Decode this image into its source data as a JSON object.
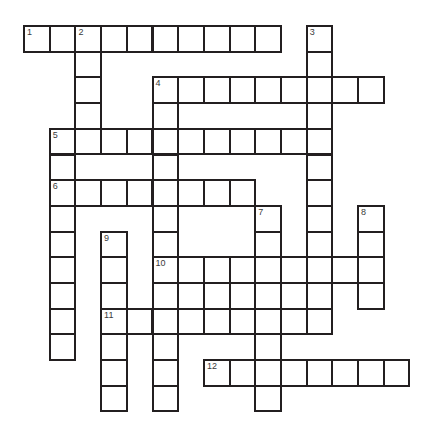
{
  "puzzle": {
    "title": "Crossword Puzzle Grid",
    "type": "crossword-grid",
    "grid": {
      "origin_x": 23,
      "origin_y": 25,
      "cell_size": 25.7,
      "columns": 16,
      "rows": 15,
      "cell_fill": "#ffffff",
      "cell_border": "#231f20",
      "background": "#ffffff"
    },
    "numbers": [
      {
        "label": "1",
        "col": 1,
        "row": 1
      },
      {
        "label": "2",
        "col": 3,
        "row": 1
      },
      {
        "label": "3",
        "col": 12,
        "row": 1
      },
      {
        "label": "4",
        "col": 6,
        "row": 3
      },
      {
        "label": "5",
        "col": 2,
        "row": 5
      },
      {
        "label": "6",
        "col": 2,
        "row": 7
      },
      {
        "label": "7",
        "col": 10,
        "row": 8
      },
      {
        "label": "8",
        "col": 14,
        "row": 8
      },
      {
        "label": "9",
        "col": 4,
        "row": 9
      },
      {
        "label": "10",
        "col": 6,
        "row": 10
      },
      {
        "label": "11",
        "col": 4,
        "row": 12
      },
      {
        "label": "12",
        "col": 8,
        "row": 14
      }
    ],
    "entries": [
      {
        "number": "1",
        "direction": "across",
        "col": 1,
        "row": 1,
        "length": 10
      },
      {
        "number": "2",
        "direction": "down",
        "col": 3,
        "row": 1,
        "length": 13
      },
      {
        "number": "3",
        "direction": "down",
        "col": 12,
        "row": 1,
        "length": 12
      },
      {
        "number": "4",
        "direction": "across",
        "col": 6,
        "row": 3,
        "length": 9
      },
      {
        "number": "4",
        "direction": "down",
        "col": 6,
        "row": 3,
        "length": 12
      },
      {
        "number": "5",
        "direction": "across",
        "col": 2,
        "row": 5,
        "length": 10
      },
      {
        "number": "6",
        "direction": "across",
        "col": 2,
        "row": 7,
        "length": 8
      },
      {
        "number": "6",
        "direction": "down",
        "col": 2,
        "row": 7,
        "length": 7
      },
      {
        "number": "7",
        "direction": "down",
        "col": 10,
        "row": 8,
        "length": 7
      },
      {
        "number": "8",
        "direction": "down",
        "col": 14,
        "row": 8,
        "length": 4
      },
      {
        "number": "9",
        "direction": "down",
        "col": 4,
        "row": 9,
        "length": 6
      },
      {
        "number": "10",
        "direction": "across",
        "col": 6,
        "row": 10,
        "length": 9
      },
      {
        "number": "11",
        "direction": "across",
        "col": 4,
        "row": 12,
        "length": 8
      },
      {
        "number": "12",
        "direction": "across",
        "col": 8,
        "row": 14,
        "length": 8
      }
    ],
    "cells": [
      {
        "col": 1,
        "row": 1
      },
      {
        "col": 2,
        "row": 1
      },
      {
        "col": 3,
        "row": 1
      },
      {
        "col": 4,
        "row": 1
      },
      {
        "col": 5,
        "row": 1
      },
      {
        "col": 6,
        "row": 1
      },
      {
        "col": 7,
        "row": 1
      },
      {
        "col": 8,
        "row": 1
      },
      {
        "col": 9,
        "row": 1
      },
      {
        "col": 10,
        "row": 1
      },
      {
        "col": 12,
        "row": 1
      },
      {
        "col": 3,
        "row": 2
      },
      {
        "col": 12,
        "row": 2
      },
      {
        "col": 3,
        "row": 3
      },
      {
        "col": 6,
        "row": 3
      },
      {
        "col": 7,
        "row": 3
      },
      {
        "col": 8,
        "row": 3
      },
      {
        "col": 9,
        "row": 3
      },
      {
        "col": 10,
        "row": 3
      },
      {
        "col": 11,
        "row": 3
      },
      {
        "col": 12,
        "row": 3
      },
      {
        "col": 13,
        "row": 3
      },
      {
        "col": 14,
        "row": 3
      },
      {
        "col": 3,
        "row": 4
      },
      {
        "col": 6,
        "row": 4
      },
      {
        "col": 12,
        "row": 4
      },
      {
        "col": 2,
        "row": 5
      },
      {
        "col": 3,
        "row": 5
      },
      {
        "col": 4,
        "row": 5
      },
      {
        "col": 5,
        "row": 5
      },
      {
        "col": 6,
        "row": 5
      },
      {
        "col": 7,
        "row": 5
      },
      {
        "col": 8,
        "row": 5
      },
      {
        "col": 9,
        "row": 5
      },
      {
        "col": 10,
        "row": 5
      },
      {
        "col": 11,
        "row": 5
      },
      {
        "col": 12,
        "row": 5
      },
      {
        "col": 2,
        "row": 6
      },
      {
        "col": 6,
        "row": 6
      },
      {
        "col": 12,
        "row": 6
      },
      {
        "col": 2,
        "row": 7
      },
      {
        "col": 3,
        "row": 7
      },
      {
        "col": 4,
        "row": 7
      },
      {
        "col": 5,
        "row": 7
      },
      {
        "col": 6,
        "row": 7
      },
      {
        "col": 7,
        "row": 7
      },
      {
        "col": 8,
        "row": 7
      },
      {
        "col": 9,
        "row": 7
      },
      {
        "col": 12,
        "row": 7
      },
      {
        "col": 2,
        "row": 8
      },
      {
        "col": 6,
        "row": 8
      },
      {
        "col": 10,
        "row": 8
      },
      {
        "col": 12,
        "row": 8
      },
      {
        "col": 14,
        "row": 8
      },
      {
        "col": 2,
        "row": 9
      },
      {
        "col": 4,
        "row": 9
      },
      {
        "col": 6,
        "row": 9
      },
      {
        "col": 10,
        "row": 9
      },
      {
        "col": 12,
        "row": 9
      },
      {
        "col": 14,
        "row": 9
      },
      {
        "col": 2,
        "row": 10
      },
      {
        "col": 4,
        "row": 10
      },
      {
        "col": 6,
        "row": 10
      },
      {
        "col": 7,
        "row": 10
      },
      {
        "col": 8,
        "row": 10
      },
      {
        "col": 9,
        "row": 10
      },
      {
        "col": 10,
        "row": 10
      },
      {
        "col": 11,
        "row": 10
      },
      {
        "col": 12,
        "row": 10
      },
      {
        "col": 13,
        "row": 10
      },
      {
        "col": 14,
        "row": 10
      },
      {
        "col": 2,
        "row": 11
      },
      {
        "col": 4,
        "row": 11
      },
      {
        "col": 6,
        "row": 11
      },
      {
        "col": 8,
        "row": 11
      },
      {
        "col": 10,
        "row": 11
      },
      {
        "col": 12,
        "row": 11
      },
      {
        "col": 14,
        "row": 11
      },
      {
        "col": 2,
        "row": 12
      },
      {
        "col": 4,
        "row": 12
      },
      {
        "col": 5,
        "row": 12
      },
      {
        "col": 6,
        "row": 12
      },
      {
        "col": 7,
        "row": 12
      },
      {
        "col": 8,
        "row": 12
      },
      {
        "col": 9,
        "row": 12
      },
      {
        "col": 10,
        "row": 12
      },
      {
        "col": 11,
        "row": 12
      },
      {
        "col": 12,
        "row": 12
      },
      {
        "col": 2,
        "row": 13
      },
      {
        "col": 4,
        "row": 13
      },
      {
        "col": 6,
        "row": 13
      },
      {
        "col": 10,
        "row": 13
      },
      {
        "col": 4,
        "row": 14
      },
      {
        "col": 6,
        "row": 14
      },
      {
        "col": 8,
        "row": 14
      },
      {
        "col": 9,
        "row": 14
      },
      {
        "col": 10,
        "row": 14
      },
      {
        "col": 11,
        "row": 14
      },
      {
        "col": 12,
        "row": 14
      },
      {
        "col": 13,
        "row": 14
      },
      {
        "col": 14,
        "row": 14
      },
      {
        "col": 15,
        "row": 14
      },
      {
        "col": 4,
        "row": 15
      },
      {
        "col": 6,
        "row": 15
      },
      {
        "col": 10,
        "row": 15
      }
    ]
  }
}
